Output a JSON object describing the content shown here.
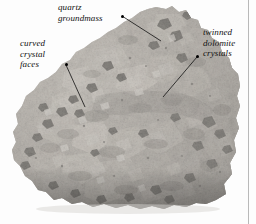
{
  "figure": {
    "kind": "annotated-photograph",
    "background_color": "#fdfdfd",
    "gutter_rule_color": "#b9b9b9"
  },
  "annotations": [
    {
      "id": "quartz",
      "text": "quartz\ngroundmass",
      "dot": {
        "x": 121,
        "y": 15
      },
      "line_end": {
        "x": 161,
        "y": 41
      }
    },
    {
      "id": "curved",
      "text": "curved\ncrystal\nfaces",
      "dot": {
        "x": 65,
        "y": 63
      },
      "line_end": {
        "x": 85,
        "y": 107
      }
    },
    {
      "id": "dolomite",
      "text": "twinned\ndolomite\ncrystals",
      "dot": {
        "x": 196,
        "y": 55
      },
      "line_end": {
        "x": 163,
        "y": 97
      }
    }
  ],
  "photo": {
    "description": "grayscale photograph of a botryoidal quartz-dolomite rock specimen on white background",
    "palette": {
      "highlight": "#e8e6e2",
      "light": "#cfccc6",
      "mid": "#a9a5a0",
      "shadow": "#7b7874",
      "dark": "#4f4d4b",
      "black_crystal": "#1d1c1b"
    }
  }
}
